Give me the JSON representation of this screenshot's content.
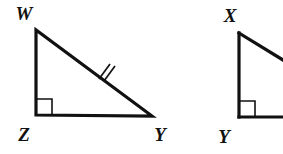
{
  "figure": {
    "background_color": "#ffffff",
    "stroke_color": "#111111",
    "canvas": {
      "width": 283,
      "height": 154
    },
    "triangles": [
      {
        "name": "triangle-wzy",
        "vertices": [
          {
            "label": "W",
            "x": 36,
            "y": 30,
            "label_x": 24,
            "label_y": 20
          },
          {
            "label": "Z",
            "x": 36,
            "y": 115,
            "label_x": 24,
            "label_y": 141
          },
          {
            "label": "Y",
            "x": 152,
            "y": 116,
            "label_x": 155,
            "label_y": 141
          }
        ],
        "right_angle_at": "Z",
        "tick_marks": {
          "side": "WY",
          "count": 2
        },
        "cropped": false
      },
      {
        "name": "triangle-xy",
        "vertices": [
          {
            "label": "X",
            "x": 239,
            "y": 33,
            "label_x": 227,
            "label_y": 22
          },
          {
            "label": "Y",
            "x": 239,
            "y": 117,
            "label_x": 220,
            "label_y": 143
          }
        ],
        "right_angle_at": "Y",
        "tick_marks": {
          "side": "",
          "count": 0
        },
        "cropped": true
      }
    ]
  },
  "geometry_paths": {
    "triangle1_outline": "M 36 30 L 36 115 L 152 116 Z",
    "triangle1_right_angle": "M 36 99 L 52 99 L 52 115",
    "triangle1_tick_a": "M 99 79 L 110 64",
    "triangle1_tick_b": "M 104 81 L 115 66",
    "triangle2_leg_vertical": "M 239 33 L 239 117",
    "triangle2_leg_horizontal": "M 239 117 L 283 117",
    "triangle2_hypotenuse": "M 239 33 L 283 60",
    "triangle2_right_angle": "M 239 101 L 255 101 L 255 117"
  },
  "labels": {
    "w": "W",
    "z": "Z",
    "y1": "Y",
    "x": "X",
    "y2": "Y"
  }
}
